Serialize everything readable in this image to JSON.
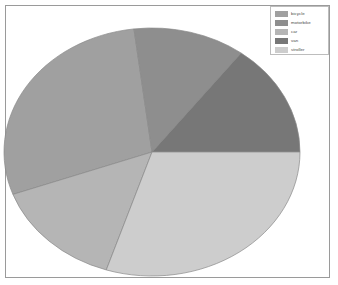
{
  "figure": {
    "background_color": "#ffffff",
    "frame_color": "#9a9a9a"
  },
  "legend": {
    "position": "top-right",
    "border_color": "#bdbdbd",
    "entries": [
      {
        "label": "bicycle",
        "color": "#a0a0a0"
      },
      {
        "label": "motorbike",
        "color": "#8e8e8e"
      },
      {
        "label": "car",
        "color": "#b5b5b5"
      },
      {
        "label": "van",
        "color": "#777777"
      },
      {
        "label": "stroller",
        "color": "#cdcdcd"
      }
    ]
  },
  "chart_data": {
    "type": "pie",
    "title": "",
    "xlabel": "",
    "ylabel": "",
    "grid": false,
    "legend_position": "top-right",
    "categories": [
      "bicycle",
      "motorbike",
      "car",
      "van",
      "stroller"
    ],
    "values": [
      29,
      12,
      14,
      15,
      30
    ],
    "colors": [
      "#a0a0a0",
      "#8e8e8e",
      "#b5b5b5",
      "#777777",
      "#cdcdcd"
    ],
    "slice_start_angles_deg": [
      97,
      53,
      200,
      0,
      252
    ],
    "slice_end_angles_deg": [
      200,
      97,
      252,
      53,
      360
    ],
    "angle_direction": "counterclockwise",
    "start_angle_reference": "3 o'clock",
    "slices": [
      {
        "label": "bicycle",
        "value": 29,
        "color": "#a0a0a0",
        "start_deg": 97,
        "end_deg": 200
      },
      {
        "label": "motorbike",
        "value": 12,
        "color": "#8e8e8e",
        "start_deg": 53,
        "end_deg": 97
      },
      {
        "label": "car",
        "value": 14,
        "color": "#b5b5b5",
        "start_deg": 200,
        "end_deg": 252
      },
      {
        "label": "van",
        "value": 15,
        "color": "#777777",
        "start_deg": 0,
        "end_deg": 53
      },
      {
        "label": "stroller",
        "value": 30,
        "color": "#cdcdcd",
        "start_deg": 252,
        "end_deg": 360
      }
    ],
    "geometry": {
      "center_x": 152,
      "center_y": 130,
      "radius_x": 148,
      "radius_y": 124,
      "shape": "ellipse",
      "edge_color": "#8a8a8a"
    },
    "data_labels_shown": false,
    "percent_labels_shown": false
  }
}
